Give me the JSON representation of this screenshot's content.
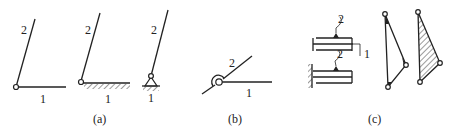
{
  "figure": {
    "panels": [
      {
        "id": "a",
        "caption": "(a)",
        "subfigures": [
          {
            "link_upper": "2",
            "link_lower": "1",
            "type": "revolute-pair-free"
          },
          {
            "link_upper": "2",
            "link_lower": "1",
            "type": "revolute-pair-ground"
          },
          {
            "link_upper": "2",
            "link_lower": "1",
            "type": "revolute-pair-pivot-support"
          }
        ]
      },
      {
        "id": "b",
        "caption": "(b)",
        "subfigures": [
          {
            "link_upper": "2",
            "link_lower": "1",
            "type": "revolute-pair-crossing"
          }
        ]
      },
      {
        "id": "c",
        "caption": "(c)",
        "subfigures": [
          {
            "link_upper": "2",
            "link_lower": "1",
            "type": "prismatic-pair-slider"
          },
          {
            "link_upper": "2",
            "type": "prismatic-pair-ground"
          },
          {
            "type": "ternary-link-outline"
          },
          {
            "type": "ternary-link-hatched"
          }
        ]
      }
    ],
    "colors": {
      "stroke": "#222222",
      "background": "#ffffff"
    }
  }
}
